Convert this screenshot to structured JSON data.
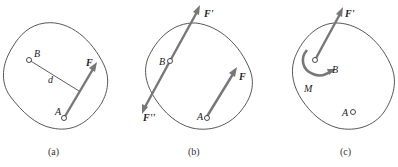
{
  "figure": {
    "panels": [
      {
        "caption": "(a)",
        "labels": {
          "B": "B",
          "A": "A",
          "F": "F",
          "d": "d"
        }
      },
      {
        "caption": "(b)",
        "labels": {
          "B": "B",
          "A": "A",
          "F": "F",
          "F1": "F'",
          "F2": "F''"
        }
      },
      {
        "caption": "(c)",
        "labels": {
          "B": "B",
          "A": "A",
          "F1": "F'",
          "M": "M"
        }
      }
    ],
    "colors": {
      "arrow": "#777777",
      "outline": "#444444"
    }
  }
}
